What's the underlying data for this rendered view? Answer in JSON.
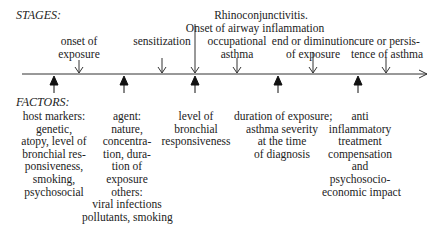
{
  "headers": {
    "stages": "STAGES:",
    "factors": "FACTORS:"
  },
  "stages": [
    {
      "lines": [
        "onset of",
        "exposure"
      ]
    },
    {
      "lines": [
        "sensitization"
      ]
    },
    {
      "lines": [
        "Rhinoconjunctivitis.",
        "Onset of airway inflammation"
      ]
    },
    {
      "lines": [
        "occupational",
        "asthma"
      ]
    },
    {
      "lines": [
        "end or diminution",
        "of exposure"
      ]
    },
    {
      "lines": [
        "cure or persis-",
        "tence of asthma"
      ]
    }
  ],
  "factors": [
    {
      "lines": [
        "host markers:",
        "genetic,",
        "atopy, level of",
        "bronchial res-",
        "ponsiveness,",
        "smoking,",
        "psychosocial"
      ]
    },
    {
      "lines": [
        "agent:",
        "nature,",
        "concentra-",
        "tion, dura-",
        "tion of",
        "exposure",
        "others:",
        "viral infections",
        "pollutants, smoking"
      ]
    },
    {
      "lines": [
        "level of",
        "bronchial",
        "responsiveness"
      ]
    },
    {
      "lines": [
        "duration of exposure;",
        "asthma severity",
        "at the time",
        "of diagnosis"
      ]
    },
    {
      "lines": [
        "anti",
        "inflammatory",
        "treatment",
        "compensation",
        "and",
        "psychosocio-",
        "economic impact"
      ]
    }
  ]
}
